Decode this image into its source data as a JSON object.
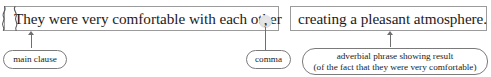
{
  "diagram": {
    "type": "sentence-annotation-diagram",
    "sentence_boxes": [
      {
        "id": "main-clause",
        "text": "They were very comfortable with each other"
      },
      {
        "id": "adverbial-phrase",
        "text": "creating a pleasant atmosphere."
      }
    ],
    "punctuation": {
      "comma_glyph": ",",
      "highlight_color": "#e2e2e2"
    },
    "separator": {
      "name": "double-brace-separator",
      "glyph": "}{",
      "color": "#5a5a5a"
    },
    "labels": [
      {
        "id": "main-clause-label",
        "lines": [
          "main clause"
        ]
      },
      {
        "id": "comma-label",
        "lines": [
          "comma"
        ]
      },
      {
        "id": "adverbial-label",
        "lines": [
          "adverbial phrase showing result",
          "(of the fact that they were very comfortable)"
        ]
      }
    ],
    "colors": {
      "box_border": "#9b9b9b",
      "pill_border": "#7a7a7a",
      "connector": "#6e6e6e",
      "text": "#1b1b1b",
      "background": "#ffffff"
    }
  }
}
